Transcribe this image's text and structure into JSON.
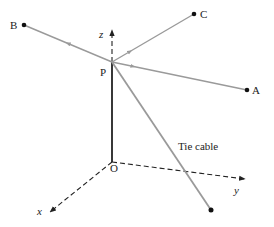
{
  "diagram": {
    "type": "3d-vector-diagram",
    "colors": {
      "axis": "#222222",
      "cable": "#9a9a9a",
      "pole": "#222222",
      "point": "#111111",
      "background": "#ffffff"
    },
    "axes": {
      "x": {
        "label": "x"
      },
      "y": {
        "label": "y"
      },
      "z": {
        "label": "z"
      }
    },
    "points": {
      "origin": {
        "label": "O"
      },
      "P": {
        "label": "P"
      },
      "A": {
        "label": "A"
      },
      "B": {
        "label": "B"
      },
      "C": {
        "label": "C"
      }
    },
    "annotations": {
      "tie_cable": "Tie cable"
    }
  }
}
